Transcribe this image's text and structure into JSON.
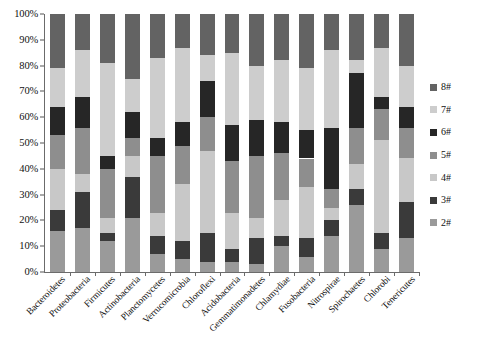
{
  "chart_data": {
    "type": "bar",
    "subtype": "stacked-100-percent",
    "title": "",
    "xlabel": "",
    "ylabel": "",
    "ylim": [
      0,
      100
    ],
    "y_tick_labels": [
      "0%",
      "10%",
      "20%",
      "30%",
      "40%",
      "50%",
      "60%",
      "70%",
      "80%",
      "90%",
      "100%"
    ],
    "y_tick_values": [
      0,
      10,
      20,
      30,
      40,
      50,
      60,
      70,
      80,
      90,
      100
    ],
    "grid": false,
    "legend_position": "right",
    "categories": [
      "Bacteroidetes",
      "Proteobacteria",
      "Firmicutes",
      "Actinobacteria",
      "Planctomycetes",
      "Verrucomicrobia",
      "Chloroflexi",
      "Acidobacteria",
      "Gemmatimonadetes",
      "Chlamydiae",
      "Fusobacteria",
      "Nitrospirae",
      "Spirochaetes",
      "Chlorobi",
      "Tenericutes"
    ],
    "series": [
      {
        "name": "2#",
        "color": "#9a9a9a",
        "values": [
          16,
          17,
          12,
          21,
          7,
          5,
          4,
          4,
          3,
          10,
          6,
          14,
          26,
          9,
          13
        ]
      },
      {
        "name": "3#",
        "color": "#3a3a3a",
        "values": [
          8,
          14,
          3,
          16,
          7,
          7,
          11,
          5,
          10,
          4,
          7,
          6,
          6,
          6,
          14
        ]
      },
      {
        "name": "4#",
        "color": "#c8c8c8",
        "values": [
          16,
          7,
          6,
          8,
          9,
          22,
          32,
          14,
          8,
          14,
          20,
          5,
          10,
          36,
          17
        ]
      },
      {
        "name": "5#",
        "color": "#8e8e8e",
        "values": [
          13,
          18,
          19,
          7,
          22,
          15,
          13,
          20,
          24,
          18,
          11,
          7,
          14,
          12,
          12
        ]
      },
      {
        "name": "6#",
        "color": "#262626",
        "values": [
          11,
          12,
          5,
          10,
          7,
          9,
          14,
          14,
          14,
          12,
          11,
          24,
          21,
          5,
          8
        ]
      },
      {
        "name": "7#",
        "color": "#cdcdcd",
        "values": [
          15,
          18,
          36,
          13,
          31,
          29,
          10,
          28,
          21,
          24,
          24,
          30,
          5,
          19,
          16
        ]
      },
      {
        "name": "8#",
        "color": "#636363",
        "values": [
          21,
          14,
          19,
          25,
          17,
          13,
          16,
          15,
          20,
          18,
          21,
          14,
          18,
          13,
          20
        ]
      }
    ],
    "legend_entries_top_to_bottom": [
      "8#",
      "7#",
      "6#",
      "5#",
      "4#",
      "3#",
      "2#"
    ],
    "axis_color": "#6b6b6b",
    "background_color": "#ffffff"
  }
}
